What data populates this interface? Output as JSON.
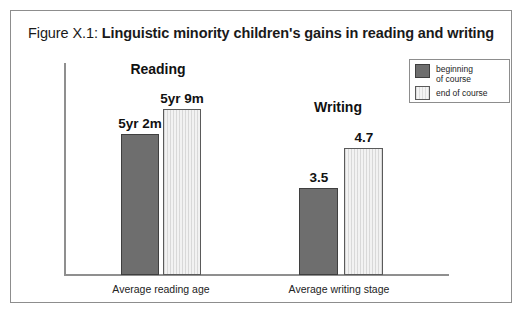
{
  "figure": {
    "title_prefix": "Figure X.1: ",
    "title_main": "Linguistic minority children's gains in reading and writing"
  },
  "legend": {
    "beginning_label": "beginning\nof course",
    "end_label": "end of course",
    "beginning_color": "#6e6e6e",
    "end_color": "#f2f2f2"
  },
  "groups": {
    "reading_header": "Reading",
    "writing_header": "Writing"
  },
  "axis": {
    "reading_tick": "Average reading age",
    "writing_tick": "Average writing stage"
  },
  "values": {
    "reading_beginning": "5yr 2m",
    "reading_end": "5yr 9m",
    "writing_beginning": "3.5",
    "writing_end": "4.7"
  },
  "chart_data": {
    "type": "bar",
    "title": "Figure X.1: Linguistic minority children's gains in reading and writing",
    "xlabel": "",
    "ylabel": "",
    "grid": false,
    "legend_position": "top-right",
    "categories": [
      "Average reading age",
      "Average writing stage"
    ],
    "group_headers": [
      "Reading",
      "Writing"
    ],
    "series": [
      {
        "name": "beginning of course",
        "color": "#6e6e6e",
        "values": [
          62,
          38
        ],
        "labels": [
          "5yr 2m",
          "3.5"
        ]
      },
      {
        "name": "end of course",
        "color": "#f2f2f2",
        "values": [
          69,
          47
        ],
        "labels": [
          "5yr 9m",
          "4.7"
        ]
      }
    ]
  }
}
